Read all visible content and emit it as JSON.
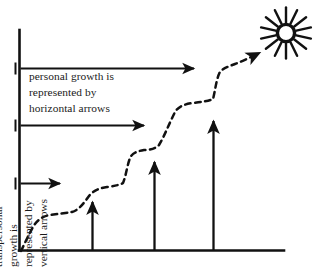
{
  "diagram": {
    "ink_color": "#111111",
    "text_color": "#1a1a1a",
    "background_color": "#ffffff",
    "captions": {
      "horizontal": {
        "lines": [
          "personal growth is",
          "represented by",
          "horizontal arrows"
        ],
        "line1": "personal growth is",
        "line2": "represented by",
        "line3": "horizontal arrows"
      },
      "vertical": {
        "lines": [
          "transpersonal",
          "growth is",
          "represented by",
          "vertical arrows"
        ],
        "line1": "transpersonal",
        "line2": "growth is",
        "line3": "represented by",
        "line4": "vertical arrows"
      }
    },
    "axes": {
      "y_axis": {
        "x": 19,
        "y_top": 30,
        "y_bottom": 250
      },
      "x_axis": {
        "y": 250,
        "x_left": 19,
        "x_right": 284
      }
    },
    "horizontal_arrows": [
      {
        "name": "horizontal-arrow-top",
        "x_start": 20,
        "x_end": 200,
        "y": 68
      },
      {
        "name": "horizontal-arrow-middle",
        "x_start": 20,
        "x_end": 150,
        "y": 125
      },
      {
        "name": "horizontal-arrow-bottom",
        "x_start": 20,
        "x_end": 66,
        "y": 183
      }
    ],
    "vertical_arrows": [
      {
        "name": "vertical-arrow-1",
        "x": 92,
        "y_base": 250,
        "y_tip": 196
      },
      {
        "name": "vertical-arrow-2",
        "x": 154,
        "y_base": 250,
        "y_tip": 156
      },
      {
        "name": "vertical-arrow-3",
        "x": 213,
        "y_base": 250,
        "y_tip": 115
      }
    ],
    "dashed_path": {
      "name": "growth-staircase-path",
      "style": "dashed",
      "points": [
        [
          21,
          251
        ],
        [
          26,
          241
        ],
        [
          32,
          228
        ],
        [
          38,
          219
        ],
        [
          48,
          215
        ],
        [
          60,
          213
        ],
        [
          70,
          212
        ],
        [
          80,
          206
        ],
        [
          88,
          196
        ],
        [
          95,
          190
        ],
        [
          106,
          187
        ],
        [
          116,
          186
        ],
        [
          122,
          184
        ],
        [
          126,
          172
        ],
        [
          129,
          160
        ],
        [
          133,
          154
        ],
        [
          142,
          151
        ],
        [
          152,
          150
        ],
        [
          158,
          146
        ],
        [
          166,
          130
        ],
        [
          174,
          113
        ],
        [
          180,
          106
        ],
        [
          192,
          103
        ],
        [
          204,
          101
        ],
        [
          213,
          100
        ],
        [
          217,
          88
        ],
        [
          220,
          76
        ],
        [
          224,
          71
        ],
        [
          238,
          64
        ],
        [
          252,
          57
        ],
        [
          263,
          52
        ]
      ],
      "arrow_tip": [
        263,
        52
      ]
    },
    "sun": {
      "name": "sun-icon",
      "center_x": 286,
      "center_y": 33,
      "ray_count": 14,
      "inner_radius": 10,
      "outer_radius": 25,
      "core_radius": 8.5
    }
  }
}
